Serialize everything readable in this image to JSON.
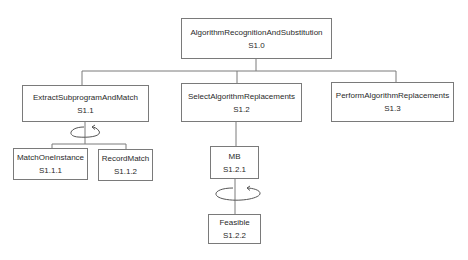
{
  "diagram": {
    "type": "hierarchy-chart",
    "nodes": [
      {
        "key": "root",
        "name": "AlgorithmRecognitionAndSubstitution",
        "id": "S1.0"
      },
      {
        "key": "n11",
        "name": "ExtractSubprogramAndMatch",
        "id": "S1.1"
      },
      {
        "key": "n12",
        "name": "SelectAlgorithmReplacements",
        "id": "S1.2"
      },
      {
        "key": "n13",
        "name": "PerformAlgorithmReplacements",
        "id": "S1.3"
      },
      {
        "key": "n111",
        "name": "MatchOneInstance",
        "id": "S1.1.1"
      },
      {
        "key": "n112",
        "name": "RecordMatch",
        "id": "S1.1.2"
      },
      {
        "key": "n121",
        "name": "MB",
        "id": "S1.2.1"
      },
      {
        "key": "n122",
        "name": "Feasible",
        "id": "S1.2.2"
      }
    ],
    "edges": [
      {
        "from": "S1.0",
        "to": "S1.1"
      },
      {
        "from": "S1.0",
        "to": "S1.2"
      },
      {
        "from": "S1.0",
        "to": "S1.3"
      },
      {
        "from": "S1.1",
        "to": "S1.1.1"
      },
      {
        "from": "S1.1",
        "to": "S1.1.2"
      },
      {
        "from": "S1.2",
        "to": "S1.2.1"
      },
      {
        "from": "S1.2",
        "to": "S1.2.2"
      }
    ],
    "loops": [
      {
        "on": "S1.1",
        "label": "iteration over children"
      },
      {
        "on": "S1.2",
        "label": "iteration over children"
      }
    ],
    "colors": {
      "line": "#7a7a7a",
      "text": "#2a2a2a",
      "background": "#ffffff"
    }
  }
}
